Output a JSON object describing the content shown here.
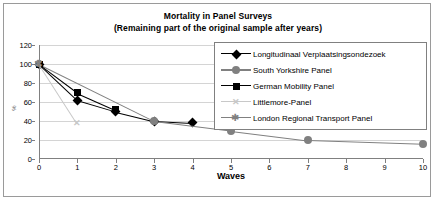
{
  "chart_data": {
    "type": "line",
    "title": "Mortality in Panel Surveys",
    "subtitle": "(Remaining part of the original sample after years)",
    "xlabel": "Waves",
    "ylabel": "%",
    "xlim": [
      0,
      10
    ],
    "ylim": [
      0,
      120
    ],
    "ytick_labels": [
      "0",
      "20",
      "40",
      "60",
      "80",
      "100",
      "120"
    ],
    "ytick_values": [
      0,
      20,
      40,
      60,
      80,
      100,
      120
    ],
    "xtick_labels": [
      "0",
      "1",
      "2",
      "3",
      "4",
      "5",
      "6",
      "7",
      "8",
      "9",
      "10"
    ],
    "xtick_values": [
      0,
      1,
      2,
      3,
      4,
      5,
      6,
      7,
      8,
      9,
      10
    ],
    "grid": "horizontal",
    "legend_position": "upper right inside plot",
    "series": [
      {
        "name": "Longitudinaal Verplaatsingsondezoek",
        "marker": "diamond",
        "color": "#000000",
        "x": [
          0,
          1,
          2,
          3,
          4
        ],
        "values": [
          100,
          62,
          50,
          40,
          38
        ]
      },
      {
        "name": "South Yorkshire Panel",
        "marker": "circle",
        "color": "#808080",
        "x": [
          0,
          3,
          5,
          7,
          10
        ],
        "values": [
          100,
          40,
          30,
          20,
          16
        ]
      },
      {
        "name": "German Mobility Panel",
        "marker": "square",
        "color": "#000000",
        "x": [
          0,
          1,
          2
        ],
        "values": [
          100,
          70,
          52
        ]
      },
      {
        "name": "Littlemore-Panel",
        "marker": "x",
        "color": "#c8c8c8",
        "x": [
          0,
          1
        ],
        "values": [
          100,
          37
        ]
      },
      {
        "name": "London Regional Transport Panel",
        "marker": "star",
        "color": "#808080",
        "x": [
          0
        ],
        "values": [
          100
        ]
      }
    ]
  }
}
